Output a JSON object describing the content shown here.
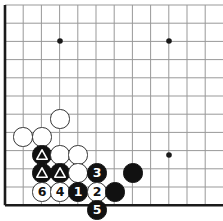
{
  "board": {
    "title": "Go board diagram",
    "width": 223,
    "height": 221,
    "grid_spacing": 18.2,
    "origin_x": 5,
    "origin_y": 5,
    "stone_radius": 9.6,
    "line_color": "#999999",
    "edge_color": "#1a1a1a",
    "background_color": "#ffffff",
    "black_color": "#111111",
    "white_color": "#ffffff",
    "white_outline_color": "#333333",
    "cols": 13,
    "rows": 12,
    "edges": {
      "left": true,
      "bottom": true,
      "top": false,
      "right": false
    },
    "star_points": [
      {
        "name": "star-point-upper-left",
        "x": 60,
        "y": 41
      },
      {
        "name": "star-point-upper-right",
        "x": 169,
        "y": 41
      },
      {
        "name": "star-point-lower-right",
        "x": 169,
        "y": 155
      }
    ],
    "stones": [
      {
        "name": "white-stone-a",
        "color": "white",
        "x": 60,
        "y": 119,
        "label": "",
        "mark": ""
      },
      {
        "name": "white-stone-b",
        "color": "white",
        "x": 23,
        "y": 137,
        "label": "",
        "mark": ""
      },
      {
        "name": "white-stone-c",
        "color": "white",
        "x": 42,
        "y": 137,
        "label": "",
        "mark": ""
      },
      {
        "name": "black-stone-triangle-a",
        "color": "black",
        "x": 42,
        "y": 155,
        "label": "",
        "mark": "triangle"
      },
      {
        "name": "white-stone-d",
        "color": "white",
        "x": 60,
        "y": 155,
        "label": "",
        "mark": ""
      },
      {
        "name": "white-stone-e",
        "color": "white",
        "x": 78,
        "y": 155,
        "label": "",
        "mark": ""
      },
      {
        "name": "black-stone-triangle-b",
        "color": "black",
        "x": 42,
        "y": 173,
        "label": "",
        "mark": "triangle"
      },
      {
        "name": "black-stone-triangle-c",
        "color": "black",
        "x": 60,
        "y": 173,
        "label": "",
        "mark": "triangle"
      },
      {
        "name": "white-stone-f",
        "color": "white",
        "x": 78,
        "y": 173,
        "label": "",
        "mark": ""
      },
      {
        "name": "black-stone-move-3",
        "color": "black",
        "x": 97,
        "y": 173,
        "label": "3",
        "mark": ""
      },
      {
        "name": "black-stone-g",
        "color": "black",
        "x": 133,
        "y": 173,
        "label": "",
        "mark": ""
      },
      {
        "name": "white-stone-move-6",
        "color": "white",
        "x": 42,
        "y": 192,
        "label": "6",
        "mark": ""
      },
      {
        "name": "white-stone-move-4",
        "color": "white",
        "x": 60,
        "y": 192,
        "label": "4",
        "mark": ""
      },
      {
        "name": "black-stone-move-1",
        "color": "black",
        "x": 78,
        "y": 192,
        "label": "1",
        "mark": ""
      },
      {
        "name": "white-stone-move-2",
        "color": "white",
        "x": 97,
        "y": 192,
        "label": "2",
        "mark": ""
      },
      {
        "name": "black-stone-h",
        "color": "black",
        "x": 115,
        "y": 192,
        "label": "",
        "mark": ""
      },
      {
        "name": "black-stone-move-5",
        "color": "black",
        "x": 97,
        "y": 210,
        "label": "5",
        "mark": ""
      }
    ]
  }
}
